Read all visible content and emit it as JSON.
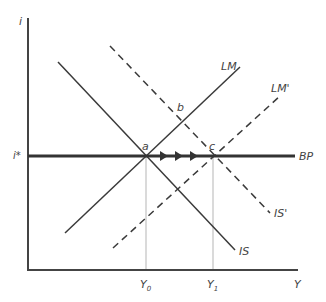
{
  "diagram": {
    "type": "economics IS-LM-BP diagram",
    "axes": {
      "y_label": "i",
      "x_label": "Y"
    },
    "colors": {
      "axis": "#444444",
      "curve": "#3a3a3a",
      "guide": "#b5b5b5"
    },
    "curves": [
      {
        "id": "IS",
        "label": "IS",
        "style": "solid",
        "from": [
          58,
          62
        ],
        "to": [
          235,
          250
        ]
      },
      {
        "id": "LM",
        "label": "LM",
        "style": "solid",
        "from": [
          65,
          233
        ],
        "to": [
          240,
          67
        ]
      },
      {
        "id": "IS_prime",
        "label": "IS'",
        "style": "dashed",
        "from": [
          110,
          46
        ],
        "to": [
          270,
          213
        ]
      },
      {
        "id": "LM_prime",
        "label": "LM'",
        "style": "dashed",
        "from": [
          113,
          248
        ],
        "to": [
          280,
          96
        ]
      },
      {
        "id": "BP",
        "label": "BP",
        "style": "thick",
        "from": [
          28,
          156
        ],
        "to": [
          295,
          156
        ]
      }
    ],
    "points": [
      {
        "id": "a",
        "label": "a",
        "x": 146,
        "y": 156
      },
      {
        "id": "b",
        "label": "b",
        "x": 181,
        "y": 111
      },
      {
        "id": "c",
        "label": "c",
        "x": 213,
        "y": 156
      }
    ],
    "level_labels": {
      "i_star": "i*",
      "Y0": "Y",
      "Y0_sub": "0",
      "Y1": "Y",
      "Y1_sub": "1"
    },
    "arrows": {
      "count": 3,
      "direction": "right",
      "along": "BP",
      "from_point": "a",
      "to_point": "c"
    }
  }
}
